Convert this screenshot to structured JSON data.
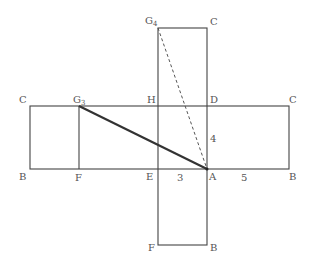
{
  "diagram": {
    "type": "box-net",
    "points": {
      "G4": {
        "label": "G₄",
        "x": 158,
        "y": 28
      },
      "C_top": {
        "label": "C",
        "x": 207,
        "y": 28
      },
      "C_left": {
        "label": "C",
        "x": 30,
        "y": 106
      },
      "G3": {
        "label": "G₃",
        "x": 79,
        "y": 106
      },
      "H": {
        "label": "H",
        "x": 158,
        "y": 106
      },
      "D": {
        "label": "D",
        "x": 207,
        "y": 106
      },
      "C_right": {
        "label": "C",
        "x": 289,
        "y": 106
      },
      "B_left": {
        "label": "B",
        "x": 30,
        "y": 169
      },
      "F_left": {
        "label": "F",
        "x": 79,
        "y": 169
      },
      "E": {
        "label": "E",
        "x": 158,
        "y": 169
      },
      "A": {
        "label": "A",
        "x": 207,
        "y": 169
      },
      "B_right": {
        "label": "B",
        "x": 289,
        "y": 169
      },
      "F_bottom": {
        "label": "F",
        "x": 158,
        "y": 245
      },
      "B_bottom": {
        "label": "B",
        "x": 207,
        "y": 245
      }
    },
    "dimensions": [
      {
        "label": "3",
        "between": "E-A"
      },
      {
        "label": "4",
        "between": "A-D"
      },
      {
        "label": "5",
        "between": "A-B"
      }
    ],
    "segments": [
      {
        "from": "G3",
        "to": "A",
        "style": "solid-thick"
      },
      {
        "from": "G4",
        "to": "A",
        "style": "dashed"
      }
    ]
  },
  "labels": {
    "G4": "G",
    "G4_sub": "4",
    "C_top": "C",
    "C_left": "C",
    "G3": "G",
    "G3_sub": "3",
    "H": "H",
    "D": "D",
    "C_right": "C",
    "B_left": "B",
    "F_left": "F",
    "E": "E",
    "A": "A",
    "B_right": "B",
    "F_bottom": "F",
    "B_bottom": "B",
    "dim_EA": "3",
    "dim_AD": "4",
    "dim_AB": "5"
  }
}
